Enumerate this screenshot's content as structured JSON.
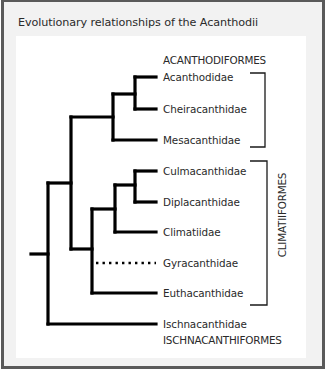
{
  "title": "Evolutionary relationships of the Acanthodii",
  "taxa": [
    {
      "name": "Acanthodidae",
      "y": 77,
      "style": "solid"
    },
    {
      "name": "Cheiracanthidae",
      "y": 109,
      "style": "solid"
    },
    {
      "name": "Mesacanthidae",
      "y": 140,
      "style": "solid"
    },
    {
      "name": "Culmacanthidae",
      "y": 171,
      "style": "solid"
    },
    {
      "name": "Diplacanthidae",
      "y": 202,
      "style": "solid"
    },
    {
      "name": "Climatiidae",
      "y": 232,
      "style": "solid"
    },
    {
      "name": "Gyracanthidae",
      "y": 263,
      "style": "dotted"
    },
    {
      "name": "Euthacanthidae",
      "y": 293,
      "style": "solid"
    },
    {
      "name": "Ischnacanthidae",
      "y": 324,
      "style": "solid"
    }
  ],
  "groups": {
    "acanthodiformes": {
      "label": "ACANTHODIFORMES",
      "members": [
        "Acanthodidae",
        "Cheiracanthidae",
        "Mesacanthidae"
      ]
    },
    "climatiiformes": {
      "label": "CLIMATIIFORMES",
      "members": [
        "Culmacanthidae",
        "Diplacanthidae",
        "Climatiidae",
        "Gyracanthidae",
        "Euthacanthidae"
      ]
    },
    "ischnacanthiformes": {
      "label": "ISCHNACANTHIFORMES",
      "members": [
        "Ischnacanthidae"
      ]
    }
  },
  "colors": {
    "line": "#000000",
    "text": "#2a2a2a",
    "frame": "#5a5a5a",
    "background": "#f2f2f2",
    "panel": "#ffffff"
  }
}
